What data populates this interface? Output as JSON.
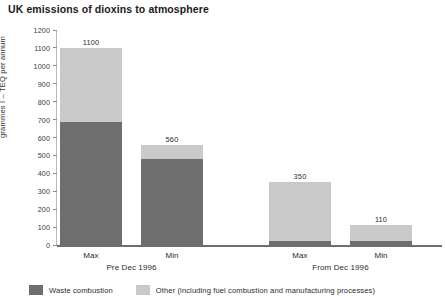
{
  "chart_data": {
    "type": "bar",
    "subtype": "stacked-bar-grouped",
    "title": "UK emissions of dioxins to atmosphere",
    "xlabel": "",
    "ylabel": "grammes I – TEQ per annum",
    "ylim": [
      0,
      1200
    ],
    "ytick_step": 100,
    "yticks": [
      1200,
      1100,
      1000,
      900,
      800,
      700,
      600,
      500,
      400,
      300,
      200,
      100,
      0
    ],
    "grid": false,
    "legend_position": "bottom-left",
    "categories": [
      "Max",
      "Min",
      "Max",
      "Min"
    ],
    "groups": [
      {
        "label": "Pre Dec 1996",
        "bars": [
          {
            "category": "Max",
            "total": 1100,
            "waste_combustion": 685,
            "other": 415
          },
          {
            "category": "Min",
            "total": 560,
            "waste_combustion": 481,
            "other": 79
          }
        ]
      },
      {
        "label": "From Dec 1996",
        "bars": [
          {
            "category": "Max",
            "total": 350,
            "waste_combustion": 24,
            "other": 326
          },
          {
            "category": "Min",
            "total": 110,
            "waste_combustion": 22,
            "other": 88
          }
        ]
      }
    ],
    "series": [
      {
        "name": "Waste combustion",
        "color": "#6e6e6e",
        "values": [
          685,
          481,
          24,
          22
        ]
      },
      {
        "name": "Other (including fuel combustion and manufacturing processes)",
        "color": "#c9c9c9",
        "values": [
          415,
          79,
          326,
          88
        ]
      }
    ],
    "totals": [
      1100,
      560,
      350,
      110
    ]
  },
  "legend": {
    "items": [
      {
        "label": "Waste combustion",
        "color": "#6e6e6e"
      },
      {
        "label": "Other (including fuel combustion and manufacturing processes)",
        "color": "#c9c9c9"
      }
    ]
  },
  "colors": {
    "waste": "#6e6e6e",
    "other": "#c9c9c9",
    "axis": "#6e6e6e",
    "text": "#2b2b2b"
  }
}
